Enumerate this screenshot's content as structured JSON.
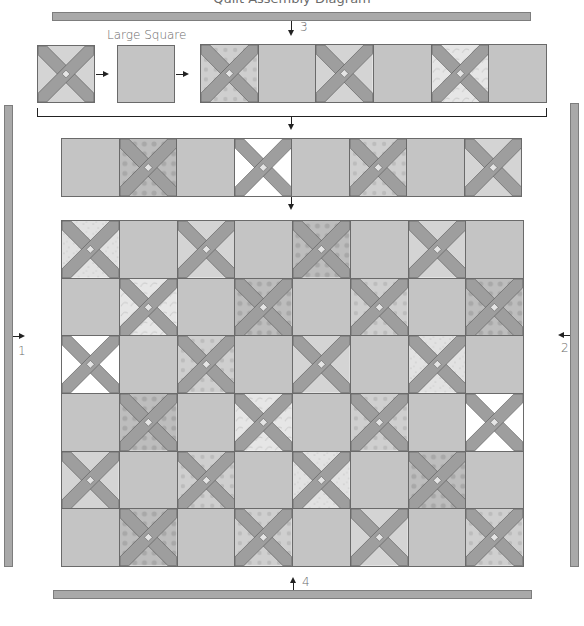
{
  "title": "Quilt Assembly Diagram",
  "labels": {
    "large_square": "Large Square",
    "step1": "1",
    "step2": "2",
    "step3": "3",
    "step4": "4"
  },
  "colors": {
    "background": "#ffffff",
    "plain_square": "#c4c4c4",
    "cross_strip": "#9e9e9e",
    "border_strip": "#a9a9a9",
    "outline": "#6a6a6a"
  },
  "fabrics": {
    "light": "#d4d4d4",
    "floral": "#cfcfcf",
    "speckle": "#e2e2e2",
    "vine": "#e6e6e6",
    "dots": "#bdbdbd",
    "white": "#ffffff"
  },
  "row_unit": {
    "block_sequence": [
      "cross-light",
      "arrow",
      "large-square",
      "arrow"
    ],
    "strip": [
      "cross-floral",
      "plain",
      "cross-light",
      "plain",
      "cross-vine",
      "plain"
    ]
  },
  "row_assembled": [
    "plain",
    "cross-dots",
    "plain",
    "cross-white",
    "plain",
    "cross-floral",
    "plain",
    "cross-light"
  ],
  "quilt_grid": [
    [
      "cross-speckle",
      "plain",
      "cross-light",
      "plain",
      "cross-dots",
      "plain",
      "cross-light",
      "plain"
    ],
    [
      "plain",
      "cross-vine",
      "plain",
      "cross-dots",
      "plain",
      "cross-floral",
      "plain",
      "cross-dots"
    ],
    [
      "cross-white",
      "plain",
      "cross-floral",
      "plain",
      "cross-light",
      "plain",
      "cross-speckle",
      "plain"
    ],
    [
      "plain",
      "cross-dots",
      "plain",
      "cross-vine",
      "plain",
      "cross-floral",
      "plain",
      "cross-white"
    ],
    [
      "cross-light",
      "plain",
      "cross-floral",
      "plain",
      "cross-speckle",
      "plain",
      "cross-dots",
      "plain"
    ],
    [
      "plain",
      "cross-dots",
      "plain",
      "cross-floral",
      "plain",
      "cross-light",
      "plain",
      "cross-floral"
    ]
  ]
}
